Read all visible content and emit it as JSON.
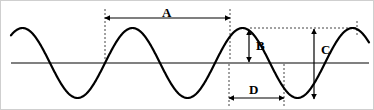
{
  "figure": {
    "width": 374,
    "height": 110,
    "background_color": "#ffffff",
    "border_color": "#cfcfcf"
  },
  "axis": {
    "name": "equilibrium-line",
    "color": "#808080",
    "y": 62,
    "x_start": 10,
    "x_end": 368,
    "stroke_width": 2.2
  },
  "wave": {
    "color": "#000000",
    "stroke_width": 2.2,
    "amplitude": 35,
    "wavelength": 110,
    "baseline_y": 62,
    "x_start": 10,
    "x_end": 368,
    "phase_x": 104
  },
  "measurements": [
    {
      "id": "A",
      "label": "A",
      "type": "horizontal",
      "meaning": "wavelength",
      "x1": 104,
      "x2": 229,
      "y": 17,
      "label_x": 161,
      "label_y": 5
    },
    {
      "id": "B",
      "label": "B",
      "type": "vertical",
      "meaning": "amplitude",
      "x": 248,
      "y1": 29,
      "y2": 61,
      "label_x": 255,
      "label_y": 38
    },
    {
      "id": "C",
      "label": "C",
      "type": "vertical",
      "meaning": "peak-to-trough height",
      "x": 313,
      "y1": 28,
      "y2": 98,
      "label_x": 320,
      "label_y": 42
    },
    {
      "id": "D",
      "label": "D",
      "type": "horizontal",
      "meaning": "half wavelength",
      "x1": 228,
      "x2": 283,
      "y": 97,
      "label_x": 248,
      "label_y": 82
    }
  ],
  "guides": {
    "color": "#444444",
    "dash": "2,2",
    "stroke_width": 1,
    "lines": [
      {
        "name": "guide-a-left",
        "x1": 104,
        "y1": 8,
        "x2": 104,
        "y2": 60
      },
      {
        "name": "guide-a-right",
        "x1": 229,
        "y1": 8,
        "x2": 229,
        "y2": 60
      },
      {
        "name": "guide-peak-c",
        "x1": 249,
        "y1": 27,
        "x2": 356,
        "y2": 27
      },
      {
        "name": "guide-d-left",
        "x1": 228,
        "y1": 63,
        "x2": 228,
        "y2": 105
      },
      {
        "name": "guide-d-right",
        "x1": 283,
        "y1": 63,
        "x2": 283,
        "y2": 105
      },
      {
        "name": "guide-c-right",
        "x1": 356,
        "y1": 20,
        "x2": 356,
        "y2": 34
      }
    ]
  }
}
